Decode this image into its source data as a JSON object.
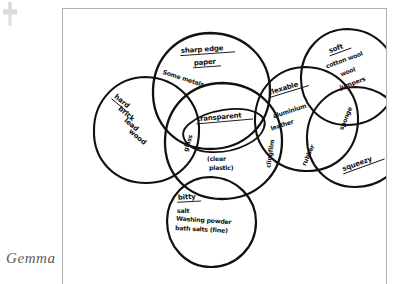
{
  "page": {
    "caption": "Gemma",
    "corner_mark_icon": "staple-mark-icon",
    "frame_label": "worksheet-frame"
  },
  "diagram": {
    "type": "venn-diagram",
    "title": "",
    "sets": [
      {
        "id": "hard",
        "heading": "hard",
        "heading_underlined": true,
        "items": [
          "brick",
          "lead",
          "wood"
        ],
        "cx": 83,
        "cy": 120,
        "rx": 52,
        "ry": 52
      },
      {
        "id": "sharp-edge",
        "heading": "sharp edge",
        "heading_underlined": true,
        "items": [
          "paper"
        ],
        "cx": 148,
        "cy": 82,
        "rx": 58,
        "ry": 58
      },
      {
        "id": "transparent",
        "heading": "transparent",
        "heading_underlined": true,
        "items": [
          "(clear",
          "plastic)"
        ],
        "cx": 160,
        "cy": 132,
        "rx": 58,
        "ry": 58
      },
      {
        "id": "flexable",
        "heading": "flexable",
        "heading_underlined": true,
        "items": [
          "aluminium",
          "leather"
        ],
        "cx": 243,
        "cy": 110,
        "rx": 52,
        "ry": 52
      },
      {
        "id": "soft",
        "heading": "soft",
        "heading_underlined": true,
        "items": [
          "cotton wool",
          "wool",
          "jumpers"
        ],
        "cx": 285,
        "cy": 68,
        "rx": 48,
        "ry": 48
      },
      {
        "id": "squeezy",
        "heading": "squeezy",
        "heading_underlined": true,
        "items": [],
        "cx": 293,
        "cy": 128,
        "rx": 50,
        "ry": 50
      },
      {
        "id": "bitty",
        "heading": "bitty",
        "heading_underlined": true,
        "items": [
          "salt",
          "Washing powder",
          "bath salts (fine)"
        ],
        "cx": 148,
        "cy": 213,
        "rx": 45,
        "ry": 45
      }
    ],
    "intersections": [
      {
        "id": "some-metals",
        "label": "Some metals",
        "between": [
          "hard",
          "sharp-edge"
        ]
      },
      {
        "id": "glass",
        "label": "glass",
        "between": [
          "hard",
          "sharp-edge",
          "transparent"
        ]
      },
      {
        "id": "clingfilm",
        "label": "clingfilm",
        "between": [
          "transparent",
          "flexable"
        ]
      },
      {
        "id": "rubber",
        "label": "rubber",
        "between": [
          "flexable",
          "squeezy"
        ]
      },
      {
        "id": "sponge",
        "label": "sponge",
        "between": [
          "flexable",
          "soft",
          "squeezy"
        ]
      }
    ]
  }
}
